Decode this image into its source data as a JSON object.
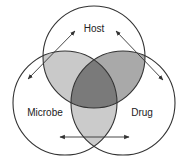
{
  "diagram": {
    "type": "venn",
    "sets": [
      {
        "id": "host",
        "label": "Host"
      },
      {
        "id": "microbe",
        "label": "Microbe"
      },
      {
        "id": "drug",
        "label": "Drug"
      }
    ],
    "regions": {
      "host_microbe_fill": "#c9c9c9",
      "host_drug_fill": "#a9a9a9",
      "microbe_drug_fill": "#cbcbcb",
      "all_three_fill": "#7a7a7a",
      "outline": "#333333"
    },
    "arrows": [
      {
        "between": [
          "Host",
          "Microbe"
        ],
        "direction": "bidirectional"
      },
      {
        "between": [
          "Host",
          "Drug"
        ],
        "direction": "bidirectional"
      },
      {
        "between": [
          "Microbe",
          "Drug"
        ],
        "direction": "bidirectional"
      }
    ]
  }
}
